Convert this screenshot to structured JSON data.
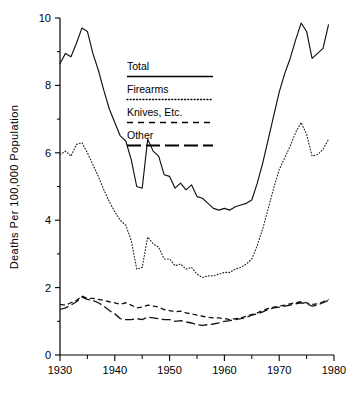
{
  "chart_data": {
    "type": "line",
    "title": "",
    "xlabel": "",
    "ylabel": "Deaths Per 100,000 Population",
    "xlim": [
      1930,
      1980
    ],
    "ylim": [
      0,
      10
    ],
    "grid": false,
    "legend_position": "inside-upper-center",
    "x_ticks_major": [
      1930,
      1940,
      1950,
      1960,
      1970,
      1980
    ],
    "x_ticks_minor": [
      1935,
      1945,
      1955,
      1965,
      1975
    ],
    "y_ticks_major": [
      0,
      2,
      4,
      6,
      8,
      10
    ],
    "y_ticks_minor": [
      1,
      3,
      5,
      7,
      9
    ],
    "x": [
      1930,
      1931,
      1932,
      1933,
      1934,
      1935,
      1936,
      1937,
      1938,
      1939,
      1940,
      1941,
      1942,
      1943,
      1944,
      1945,
      1946,
      1947,
      1948,
      1949,
      1950,
      1951,
      1952,
      1953,
      1954,
      1955,
      1956,
      1957,
      1958,
      1959,
      1960,
      1961,
      1962,
      1963,
      1964,
      1965,
      1966,
      1967,
      1968,
      1969,
      1970,
      1971,
      1972,
      1973,
      1974,
      1975,
      1976,
      1977,
      1978,
      1979
    ],
    "series": [
      {
        "name": "Total",
        "style": "solid",
        "values": [
          8.65,
          8.95,
          8.85,
          9.25,
          9.7,
          9.6,
          8.95,
          8.45,
          7.85,
          7.3,
          6.9,
          6.5,
          6.35,
          5.8,
          5.0,
          4.95,
          6.4,
          6.05,
          5.9,
          5.35,
          5.3,
          4.95,
          5.1,
          4.9,
          5.05,
          4.7,
          4.65,
          4.5,
          4.35,
          4.3,
          4.35,
          4.3,
          4.4,
          4.45,
          4.5,
          4.6,
          5.1,
          5.7,
          6.4,
          7.1,
          7.8,
          8.35,
          8.8,
          9.35,
          9.85,
          9.6,
          8.8,
          8.95,
          9.1,
          9.8
        ]
      },
      {
        "name": "Firearms",
        "style": "dotted",
        "values": [
          5.95,
          6.05,
          5.9,
          6.25,
          6.3,
          6.0,
          5.65,
          5.3,
          4.9,
          4.55,
          4.25,
          4.0,
          3.85,
          3.4,
          2.55,
          2.6,
          3.5,
          3.3,
          3.2,
          2.85,
          2.85,
          2.65,
          2.7,
          2.55,
          2.6,
          2.4,
          2.3,
          2.35,
          2.35,
          2.4,
          2.45,
          2.45,
          2.55,
          2.6,
          2.7,
          2.85,
          3.25,
          3.75,
          4.35,
          4.95,
          5.5,
          5.85,
          6.2,
          6.6,
          6.9,
          6.55,
          5.9,
          5.95,
          6.1,
          6.4
        ]
      },
      {
        "name": "Knives, Etc.",
        "style": "dashed",
        "values": [
          1.5,
          1.48,
          1.55,
          1.62,
          1.75,
          1.68,
          1.68,
          1.65,
          1.62,
          1.58,
          1.55,
          1.5,
          1.55,
          1.48,
          1.4,
          1.42,
          1.48,
          1.45,
          1.42,
          1.35,
          1.32,
          1.28,
          1.3,
          1.25,
          1.22,
          1.18,
          1.15,
          1.12,
          1.1,
          1.1,
          1.08,
          1.05,
          1.08,
          1.1,
          1.15,
          1.2,
          1.25,
          1.32,
          1.38,
          1.42,
          1.45,
          1.48,
          1.52,
          1.55,
          1.58,
          1.55,
          1.5,
          1.52,
          1.58,
          1.65
        ]
      },
      {
        "name": "Other",
        "style": "long-dashed",
        "values": [
          1.35,
          1.4,
          1.48,
          1.58,
          1.72,
          1.65,
          1.62,
          1.55,
          1.45,
          1.32,
          1.22,
          1.08,
          1.05,
          1.05,
          1.08,
          1.05,
          1.12,
          1.1,
          1.08,
          1.05,
          1.05,
          1.0,
          1.02,
          0.98,
          0.95,
          0.9,
          0.88,
          0.9,
          0.92,
          0.95,
          1.0,
          1.02,
          1.05,
          1.08,
          1.12,
          1.18,
          1.22,
          1.28,
          1.35,
          1.4,
          1.42,
          1.45,
          1.48,
          1.52,
          1.55,
          1.52,
          1.45,
          1.48,
          1.55,
          1.62
        ]
      }
    ]
  },
  "axes": {
    "y_title": "Deaths Per 100,000 Population",
    "y_labels": [
      "10",
      "8",
      "6",
      "4",
      "2",
      "0"
    ],
    "x_labels": [
      "1930",
      "1940",
      "1950",
      "1960",
      "1970",
      "1980"
    ]
  },
  "legend": {
    "entries": [
      {
        "label": "Total",
        "style": "solid"
      },
      {
        "label": "Firearms",
        "style": "dotted"
      },
      {
        "label": "Knives, Etc.",
        "style": "dashed"
      },
      {
        "label": "Other",
        "style": "long-dashed"
      }
    ]
  },
  "colors": {
    "ink": "#000000",
    "background": "#ffffff"
  }
}
